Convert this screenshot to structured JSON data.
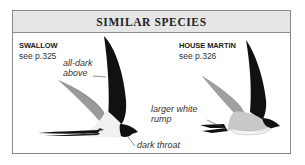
{
  "panel": {
    "title": "SIMILAR SPECIES"
  },
  "species": [
    {
      "name": "SWALLOW",
      "reference": "see p.325",
      "annotations": {
        "upper": [
          "all-dark",
          "above"
        ],
        "lower": "dark throat"
      }
    },
    {
      "name": "HOUSE MARTIN",
      "reference": "see p.326",
      "annotations": {
        "rump": [
          "larger white",
          "rump"
        ]
      }
    }
  ],
  "colors": {
    "header_bg": "#e6e6e6",
    "border": "#8a8a8a",
    "bird_dark": "#111111",
    "bird_wing_grey": "#8c8c8c",
    "bird_belly": "#f2f2f2"
  }
}
